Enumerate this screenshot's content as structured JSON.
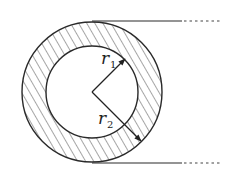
{
  "diagram": {
    "type": "annulus-cross-section",
    "center": [
      92,
      92
    ],
    "outer_radius_px": 70,
    "inner_radius_px": 46,
    "labels": {
      "r1": {
        "base": "r",
        "sub": "1"
      },
      "r2": {
        "base": "r",
        "sub": "2"
      }
    },
    "colors": {
      "stroke": "#2a2a2a",
      "hatch": "#3a3a3a",
      "background": "#ffffff"
    },
    "tangent_lines": {
      "top_y": 21,
      "bottom_y": 163,
      "solid_end_x": 182,
      "dotted_end_x": 220
    }
  }
}
